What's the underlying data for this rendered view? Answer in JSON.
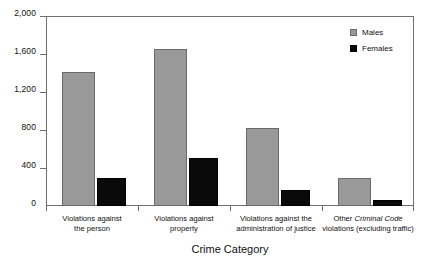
{
  "chart_data": {
    "type": "bar",
    "title": "",
    "subtitle": "",
    "xlabel": "Crime Category",
    "ylabel": "",
    "ylim": [
      0,
      2000
    ],
    "ytick_values": [
      0,
      400,
      800,
      1200,
      1600,
      2000
    ],
    "ytick_labels": [
      "0",
      "400",
      "800",
      "1,200",
      "1,600",
      "2,000"
    ],
    "grid": false,
    "legend_position": "top-right",
    "categories": [
      "Violations against the person",
      "Violations against property",
      "Violations against the administration of justice",
      "Other Criminal Code violations (excluding traffic)"
    ],
    "category_lines": [
      [
        "Violations against",
        "the person"
      ],
      [
        "Violations against",
        "property"
      ],
      [
        "Violations against the",
        "administration of justice"
      ],
      [
        "Other Criminal Code",
        "violations (excluding traffic)"
      ]
    ],
    "series": [
      {
        "name": "Males",
        "color": "#999999",
        "values": [
          1410,
          1650,
          820,
          300
        ]
      },
      {
        "name": "Females",
        "color": "#0a0a0a",
        "values": [
          295,
          510,
          165,
          65
        ]
      }
    ]
  },
  "legend": {
    "items": [
      {
        "label": "Males",
        "swatch": "males-swatch"
      },
      {
        "label": "Females",
        "swatch": "females-swatch"
      }
    ]
  },
  "axis": {
    "x_title": "Crime Category"
  }
}
